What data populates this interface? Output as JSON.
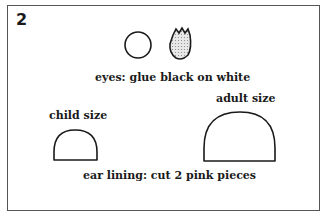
{
  "step_number": "2",
  "labels": {
    "eyes": "eyes: glue black on white",
    "child": "child size",
    "adult": "adult size",
    "ear": "ear lining: cut 2 pink pieces"
  }
}
